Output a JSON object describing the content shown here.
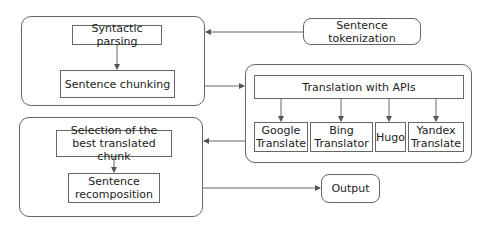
{
  "diagram": {
    "type": "flowchart",
    "nodes": {
      "tokenization": "Sentence tokenization",
      "parsing": "Syntactic parsing",
      "chunking": "Sentence chunking",
      "apis": "Translation with APIs",
      "google": "Google Translate",
      "bing": "Bing Translator",
      "hugo": "Hugo",
      "yandex": "Yandex Translate",
      "selection": "Selection of the best translated chunk",
      "recomposition": "Sentence recomposition",
      "output": "Output"
    },
    "edges": [
      [
        "tokenization",
        "preprocessing-group"
      ],
      [
        "parsing",
        "chunking"
      ],
      [
        "preprocessing-group",
        "translation-group"
      ],
      [
        "apis",
        "google"
      ],
      [
        "apis",
        "bing"
      ],
      [
        "apis",
        "hugo"
      ],
      [
        "apis",
        "yandex"
      ],
      [
        "translation-group",
        "postprocessing-group"
      ],
      [
        "selection",
        "recomposition"
      ],
      [
        "postprocessing-group",
        "output"
      ]
    ],
    "colors": {
      "stroke": "#666666",
      "text": "#222222",
      "background": "#ffffff"
    }
  }
}
